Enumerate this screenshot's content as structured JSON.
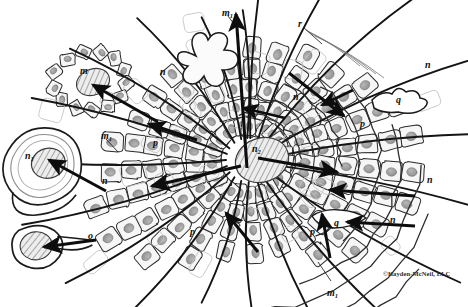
{
  "figure": {
    "background_color": "#ffffff",
    "ink_color": "#1a1a1a",
    "cell_fill": "#f4f4f4",
    "nucleus_fill": "#9a9a9a",
    "hatch_color": "#7d7d7d"
  },
  "credit": {
    "text": "©Hayden-McNeil, LLC"
  },
  "labels": [
    {
      "id": "m-top",
      "base": "m",
      "sub": "1",
      "x": 222,
      "y": 8
    },
    {
      "id": "r",
      "base": "r",
      "sub": "",
      "x": 298,
      "y": 19
    },
    {
      "id": "n-upper-left",
      "base": "n",
      "sub": "",
      "x": 160,
      "y": 67
    },
    {
      "id": "n-upper-mid",
      "base": "n",
      "sub": "",
      "x": 293,
      "y": 92
    },
    {
      "id": "n-upper-right",
      "base": "n",
      "sub": "",
      "x": 425,
      "y": 60
    },
    {
      "id": "m-left",
      "base": "m",
      "sub": "",
      "x": 80,
      "y": 66
    },
    {
      "id": "q-right",
      "base": "q",
      "sub": "",
      "x": 396,
      "y": 95
    },
    {
      "id": "p-right",
      "base": "p",
      "sub": "",
      "x": 360,
      "y": 119
    },
    {
      "id": "m1-left",
      "base": "m",
      "sub": "1",
      "x": 101,
      "y": 131
    },
    {
      "id": "p-left",
      "base": "p",
      "sub": "",
      "x": 153,
      "y": 138
    },
    {
      "id": "n1",
      "base": "n",
      "sub": "1",
      "x": 25,
      "y": 151
    },
    {
      "id": "n2",
      "base": "n",
      "sub": "2",
      "x": 252,
      "y": 144
    },
    {
      "id": "n-mid-left",
      "base": "n",
      "sub": "",
      "x": 102,
      "y": 176
    },
    {
      "id": "n-mid-right",
      "base": "n",
      "sub": "",
      "x": 427,
      "y": 175
    },
    {
      "id": "o",
      "base": "o",
      "sub": "",
      "x": 88,
      "y": 231
    },
    {
      "id": "p-lower",
      "base": "p",
      "sub": "",
      "x": 190,
      "y": 227
    },
    {
      "id": "q-lower",
      "base": "q",
      "sub": "",
      "x": 334,
      "y": 218
    },
    {
      "id": "p-lower-right",
      "base": "p",
      "sub": "",
      "x": 310,
      "y": 227
    },
    {
      "id": "n-lower-right",
      "base": "n",
      "sub": "",
      "x": 390,
      "y": 215
    },
    {
      "id": "m1-bottom",
      "base": "m",
      "sub": "1",
      "x": 327,
      "y": 288
    }
  ],
  "leader_lines": [
    {
      "id": "leader-m-top",
      "x1": 228,
      "y1": 16,
      "x2": 237,
      "y2": 28
    },
    {
      "id": "leader-r",
      "x1": 303,
      "y1": 27,
      "x2": 322,
      "y2": 44
    },
    {
      "id": "leader-m1-left",
      "x1": 106,
      "y1": 139,
      "x2": 118,
      "y2": 152
    },
    {
      "id": "leader-m1-bottom",
      "x1": 331,
      "y1": 281,
      "x2": 318,
      "y2": 262
    }
  ],
  "arrows": [
    {
      "id": "arrow-axis-up",
      "x1": 247,
      "y1": 168,
      "x2": 236,
      "y2": 14,
      "width": 3.1
    },
    {
      "id": "arrow-upper-left",
      "x1": 158,
      "y1": 122,
      "x2": 93,
      "y2": 85,
      "width": 3.0
    },
    {
      "id": "arrow-upper-left2",
      "x1": 197,
      "y1": 140,
      "x2": 149,
      "y2": 124,
      "width": 3.0
    },
    {
      "id": "arrow-left-n1",
      "x1": 106,
      "y1": 191,
      "x2": 49,
      "y2": 160,
      "width": 3.0
    },
    {
      "id": "arrow-left-o",
      "x1": 96,
      "y1": 240,
      "x2": 44,
      "y2": 247,
      "width": 3.2
    },
    {
      "id": "arrow-center-left",
      "x1": 241,
      "y1": 166,
      "x2": 152,
      "y2": 186,
      "width": 3.2
    },
    {
      "id": "arrow-center-right",
      "x1": 258,
      "y1": 158,
      "x2": 337,
      "y2": 172,
      "width": 3.2
    },
    {
      "id": "arrow-upper-right",
      "x1": 289,
      "y1": 73,
      "x2": 344,
      "y2": 116,
      "width": 3.0
    },
    {
      "id": "arrow-right-top",
      "x1": 353,
      "y1": 90,
      "x2": 322,
      "y2": 105,
      "width": 2.8
    },
    {
      "id": "arrow-right-n",
      "x1": 415,
      "y1": 196,
      "x2": 330,
      "y2": 190,
      "width": 3.0
    },
    {
      "id": "arrow-lower-right",
      "x1": 415,
      "y1": 226,
      "x2": 347,
      "y2": 222,
      "width": 3.0
    },
    {
      "id": "arrow-lower-mid",
      "x1": 258,
      "y1": 252,
      "x2": 226,
      "y2": 213,
      "width": 3.0
    },
    {
      "id": "arrow-lower-up",
      "x1": 330,
      "y1": 258,
      "x2": 322,
      "y2": 214,
      "width": 3.0
    },
    {
      "id": "arrow-upper-mid",
      "x1": 285,
      "y1": 118,
      "x2": 243,
      "y2": 108,
      "width": 2.8
    }
  ]
}
